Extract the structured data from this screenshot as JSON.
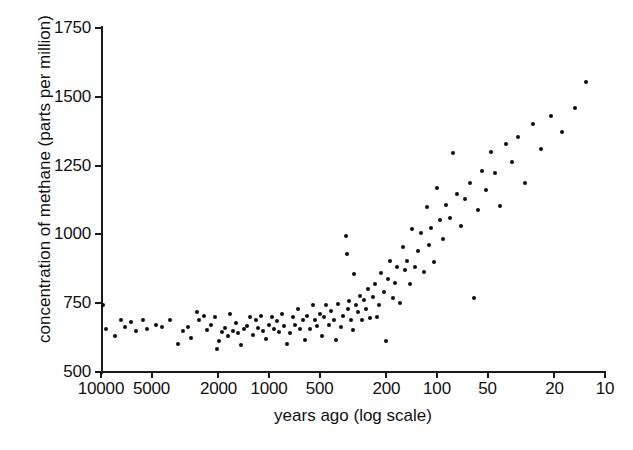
{
  "chart_data": {
    "type": "scatter",
    "title": "",
    "xlabel": "years ago (log scale)",
    "ylabel": "concentration of methane (parts per million)",
    "x_scale": "log-reversed",
    "xlim": [
      10000,
      10
    ],
    "ylim": [
      500,
      1750
    ],
    "grid": false,
    "legend": null,
    "x_ticks": [
      10000,
      5000,
      2000,
      1000,
      500,
      200,
      100,
      50,
      20,
      10
    ],
    "x_tick_labels": [
      "10000",
      "5000",
      "2000",
      "1000",
      "500",
      "200",
      "100",
      "50",
      "20",
      "10"
    ],
    "y_ticks": [
      500,
      750,
      1000,
      1250,
      1500,
      1750
    ],
    "y_tick_labels": [
      "500",
      "750",
      "1000",
      "1250",
      "1500",
      "1750"
    ],
    "marker": "filled-circle",
    "marker_color": "#0d0d0d",
    "points": [
      [
        9700,
        742
      ],
      [
        9400,
        655
      ],
      [
        8300,
        630
      ],
      [
        7600,
        690
      ],
      [
        7150,
        665
      ],
      [
        6600,
        682
      ],
      [
        6150,
        648
      ],
      [
        5600,
        688
      ],
      [
        5300,
        658
      ],
      [
        4700,
        672
      ],
      [
        4350,
        665
      ],
      [
        3900,
        690
      ],
      [
        3500,
        600
      ],
      [
        3250,
        648
      ],
      [
        3050,
        662
      ],
      [
        2900,
        622
      ],
      [
        2700,
        718
      ],
      [
        2600,
        690
      ],
      [
        2450,
        705
      ],
      [
        2350,
        652
      ],
      [
        2200,
        672
      ],
      [
        2100,
        700
      ],
      [
        2050,
        585
      ],
      [
        1980,
        612
      ],
      [
        1900,
        645
      ],
      [
        1830,
        660
      ],
      [
        1760,
        630
      ],
      [
        1700,
        712
      ],
      [
        1640,
        648
      ],
      [
        1580,
        678
      ],
      [
        1520,
        640
      ],
      [
        1460,
        598
      ],
      [
        1400,
        655
      ],
      [
        1350,
        668
      ],
      [
        1300,
        700
      ],
      [
        1250,
        636
      ],
      [
        1200,
        690
      ],
      [
        1160,
        660
      ],
      [
        1120,
        705
      ],
      [
        1080,
        650
      ],
      [
        1040,
        620
      ],
      [
        1000,
        672
      ],
      [
        965,
        700
      ],
      [
        930,
        655
      ],
      [
        900,
        685
      ],
      [
        870,
        645
      ],
      [
        840,
        712
      ],
      [
        810,
        668
      ],
      [
        780,
        600
      ],
      [
        750,
        640
      ],
      [
        720,
        700
      ],
      [
        700,
        672
      ],
      [
        675,
        730
      ],
      [
        650,
        658
      ],
      [
        630,
        690
      ],
      [
        610,
        618
      ],
      [
        590,
        702
      ],
      [
        570,
        655
      ],
      [
        550,
        745
      ],
      [
        530,
        688
      ],
      [
        515,
        668
      ],
      [
        500,
        712
      ],
      [
        485,
        630
      ],
      [
        470,
        700
      ],
      [
        455,
        745
      ],
      [
        440,
        672
      ],
      [
        425,
        720
      ],
      [
        412,
        690
      ],
      [
        400,
        618
      ],
      [
        388,
        748
      ],
      [
        375,
        665
      ],
      [
        362,
        705
      ],
      [
        350,
        995
      ],
      [
        345,
        930
      ],
      [
        340,
        728
      ],
      [
        335,
        758
      ],
      [
        325,
        690
      ],
      [
        318,
        652
      ],
      [
        310,
        855
      ],
      [
        302,
        742
      ],
      [
        295,
        718
      ],
      [
        288,
        775
      ],
      [
        280,
        690
      ],
      [
        272,
        760
      ],
      [
        265,
        730
      ],
      [
        258,
        802
      ],
      [
        250,
        695
      ],
      [
        242,
        772
      ],
      [
        235,
        820
      ],
      [
        228,
        700
      ],
      [
        222,
        745
      ],
      [
        215,
        860
      ],
      [
        208,
        790
      ],
      [
        202,
        612
      ],
      [
        196,
        838
      ],
      [
        190,
        905
      ],
      [
        184,
        770
      ],
      [
        178,
        822
      ],
      [
        172,
        880
      ],
      [
        166,
        750
      ],
      [
        160,
        955
      ],
      [
        155,
        870
      ],
      [
        150,
        905
      ],
      [
        145,
        820
      ],
      [
        140,
        1018
      ],
      [
        135,
        880
      ],
      [
        130,
        940
      ],
      [
        125,
        1005
      ],
      [
        120,
        862
      ],
      [
        115,
        1100
      ],
      [
        112,
        962
      ],
      [
        108,
        1025
      ],
      [
        104,
        898
      ],
      [
        100,
        1170
      ],
      [
        96,
        1052
      ],
      [
        92,
        985
      ],
      [
        88,
        1108
      ],
      [
        84,
        1060
      ],
      [
        80,
        1295
      ],
      [
        76,
        1148
      ],
      [
        72,
        1032
      ],
      [
        68,
        1128
      ],
      [
        64,
        1188
      ],
      [
        60,
        770
      ],
      [
        57,
        1090
      ],
      [
        54,
        1232
      ],
      [
        51,
        1160
      ],
      [
        48,
        1298
      ],
      [
        45,
        1222
      ],
      [
        42,
        1105
      ],
      [
        39,
        1330
      ],
      [
        36,
        1262
      ],
      [
        33,
        1355
      ],
      [
        30,
        1188
      ],
      [
        27,
        1400
      ],
      [
        24,
        1312
      ],
      [
        21,
        1432
      ],
      [
        18,
        1372
      ],
      [
        15,
        1460
      ],
      [
        13,
        1552
      ]
    ]
  }
}
